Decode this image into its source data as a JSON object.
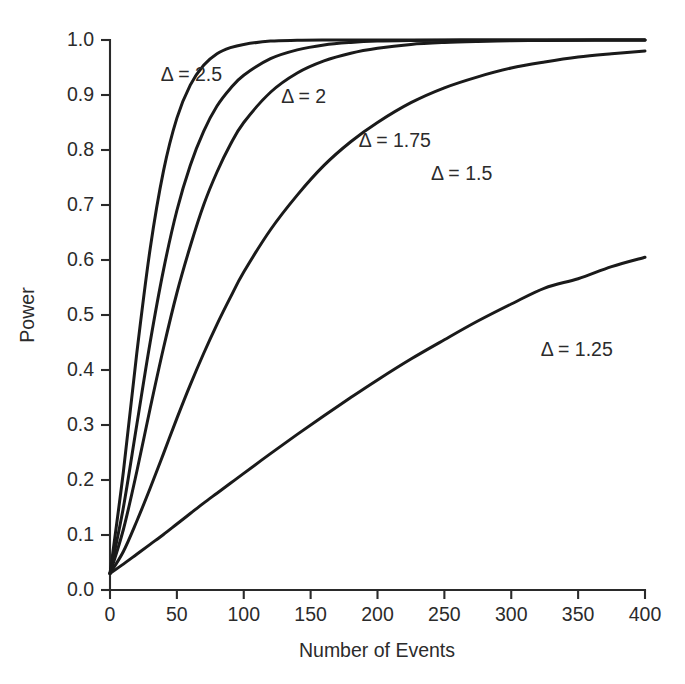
{
  "chart_data": {
    "type": "line",
    "title": "",
    "xlabel": "Number of Events",
    "ylabel": "Power",
    "xlim": [
      0,
      400
    ],
    "ylim": [
      0.0,
      1.0
    ],
    "grid": false,
    "legend_position": "inline-annotations",
    "xticks": [
      0,
      50,
      100,
      150,
      200,
      250,
      300,
      350,
      400
    ],
    "xtick_labels": [
      "0",
      "50",
      "100",
      "150",
      "200",
      "250",
      "300",
      "350",
      "400"
    ],
    "yticks": [
      0.0,
      0.1,
      0.2,
      0.3,
      0.4,
      0.5,
      0.6,
      0.7,
      0.8,
      0.9,
      1.0
    ],
    "ytick_labels": [
      "0.0",
      "0.1",
      "0.2",
      "0.3",
      "0.4",
      "0.5",
      "0.6",
      "0.7",
      "0.8",
      "0.9",
      "1.0"
    ],
    "x": [
      0,
      10,
      20,
      30,
      40,
      50,
      60,
      70,
      80,
      90,
      100,
      120,
      140,
      160,
      180,
      200,
      225,
      250,
      275,
      300,
      325,
      350,
      375,
      400
    ],
    "series": [
      {
        "name": "Δ = 2.5",
        "label": "Δ = 2.5",
        "delta": 2.5,
        "label_x": 38,
        "label_y": 0.925,
        "values": [
          0.03,
          0.215,
          0.43,
          0.62,
          0.762,
          0.858,
          0.918,
          0.954,
          0.975,
          0.986,
          0.992,
          0.998,
          0.9995,
          1.0,
          1.0,
          1.0,
          1.0,
          1.0,
          1.0,
          1.0,
          1.0,
          1.0,
          1.0,
          1.0
        ]
      },
      {
        "name": "Δ = 2",
        "label": "Δ = 2",
        "delta": 2,
        "label_x": 128,
        "label_y": 0.885,
        "values": [
          0.03,
          0.15,
          0.3,
          0.45,
          0.582,
          0.69,
          0.772,
          0.834,
          0.88,
          0.912,
          0.936,
          0.966,
          0.982,
          0.991,
          0.9955,
          0.998,
          0.9992,
          0.9997,
          0.9999,
          1.0,
          1.0,
          1.0,
          1.0,
          1.0
        ]
      },
      {
        "name": "Δ = 1.75",
        "label": "Δ = 1.75",
        "delta": 1.75,
        "label_x": 186,
        "label_y": 0.805,
        "values": [
          0.03,
          0.11,
          0.215,
          0.33,
          0.44,
          0.54,
          0.625,
          0.7,
          0.76,
          0.81,
          0.85,
          0.905,
          0.94,
          0.962,
          0.976,
          0.985,
          0.992,
          0.9955,
          0.9975,
          0.9988,
          0.9993,
          0.9997,
          0.9999,
          1.0
        ]
      },
      {
        "name": "Δ = 1.5",
        "label": "Δ = 1.5",
        "delta": 1.5,
        "label_x": 240,
        "label_y": 0.745,
        "values": [
          0.03,
          0.07,
          0.125,
          0.185,
          0.248,
          0.312,
          0.373,
          0.43,
          0.483,
          0.532,
          0.578,
          0.655,
          0.718,
          0.772,
          0.815,
          0.85,
          0.886,
          0.913,
          0.933,
          0.949,
          0.96,
          0.969,
          0.975,
          0.98
        ]
      },
      {
        "name": "Δ = 1.25",
        "label": "Δ = 1.25",
        "delta": 1.25,
        "label_x": 322,
        "label_y": 0.425,
        "values": [
          0.03,
          0.047,
          0.065,
          0.083,
          0.101,
          0.12,
          0.139,
          0.158,
          0.176,
          0.194,
          0.212,
          0.248,
          0.283,
          0.317,
          0.35,
          0.382,
          0.42,
          0.455,
          0.489,
          0.52,
          0.549,
          0.566,
          0.588,
          0.605
        ]
      }
    ]
  },
  "axes": {
    "x_title": "Number of Events",
    "y_title": "Power"
  }
}
